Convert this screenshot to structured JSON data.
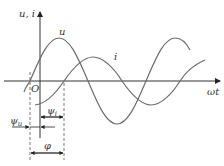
{
  "diagram": {
    "y_axis_label": "u, i",
    "x_axis_label": "ωt",
    "origin_label": "O",
    "curve_u_label": "u",
    "curve_i_label": "i",
    "psi_u_label": "ψ",
    "psi_u_sub": "u",
    "psi_i_label": "ψ",
    "psi_i_sub": "i",
    "phi_label": "φ"
  },
  "colors": {
    "curve": "#6b6b6b",
    "axis": "#333333",
    "dash": "#555555"
  }
}
